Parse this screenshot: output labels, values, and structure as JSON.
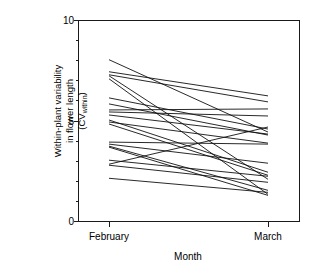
{
  "chart_data": {
    "type": "line",
    "title": "",
    "subtitle": "",
    "xlabel": "Month",
    "ylabel": "Within-plant variability in flower length (CVwithin)",
    "ylabel_line1": "Within-plant variability",
    "ylabel_line2": "in flower length",
    "ylabel_line3_main": "(CV",
    "ylabel_line3_sub": "within",
    "ylabel_line3_end": ")",
    "categories": [
      "February",
      "March"
    ],
    "x": [
      1,
      2
    ],
    "xtick_labels": [
      "February",
      "March"
    ],
    "ytick_labels": [
      "0",
      "5",
      "10"
    ],
    "ytick_values": [
      0,
      5,
      10
    ],
    "yminor_step": 1,
    "ylim": [
      0,
      10
    ],
    "xlim": [
      0,
      3
    ],
    "grid": false,
    "legend": "none",
    "annotations": [],
    "series": [
      {
        "name": "plant-01",
        "values": [
          8.05,
          4.45
        ]
      },
      {
        "name": "plant-02",
        "values": [
          7.45,
          6.25
        ]
      },
      {
        "name": "plant-03",
        "values": [
          7.3,
          5.95
        ]
      },
      {
        "name": "plant-04",
        "values": [
          7.25,
          2.1
        ]
      },
      {
        "name": "plant-05",
        "values": [
          7.1,
          1.35
        ]
      },
      {
        "name": "plant-06",
        "values": [
          6.15,
          4.6
        ]
      },
      {
        "name": "plant-07",
        "values": [
          5.85,
          4.3
        ]
      },
      {
        "name": "plant-08",
        "values": [
          5.55,
          5.6
        ]
      },
      {
        "name": "plant-09",
        "values": [
          5.45,
          5.25
        ]
      },
      {
        "name": "plant-10",
        "values": [
          5.3,
          4.35
        ]
      },
      {
        "name": "plant-11",
        "values": [
          5.05,
          2.45
        ]
      },
      {
        "name": "plant-12",
        "values": [
          4.95,
          3.9
        ]
      },
      {
        "name": "plant-13",
        "values": [
          4.85,
          2.3
        ]
      },
      {
        "name": "plant-14",
        "values": [
          3.95,
          3.85
        ]
      },
      {
        "name": "plant-15",
        "values": [
          3.85,
          2.9
        ]
      },
      {
        "name": "plant-16",
        "values": [
          3.75,
          1.55
        ]
      },
      {
        "name": "plant-17",
        "values": [
          3.7,
          1.3
        ]
      },
      {
        "name": "plant-18",
        "values": [
          3.05,
          2.25
        ]
      },
      {
        "name": "plant-19",
        "values": [
          2.8,
          1.95
        ]
      },
      {
        "name": "plant-20",
        "values": [
          2.85,
          4.7
        ]
      },
      {
        "name": "plant-21",
        "values": [
          2.15,
          1.45
        ]
      }
    ]
  },
  "axes": {
    "x_title": "Month",
    "x_tick_february": "February",
    "x_tick_march": "March",
    "y_tick_0": "0",
    "y_tick_5": "5",
    "y_tick_10": "10"
  },
  "colors": {
    "line": "#111111",
    "axis": "#1a1a1a",
    "background": "#ffffff"
  }
}
